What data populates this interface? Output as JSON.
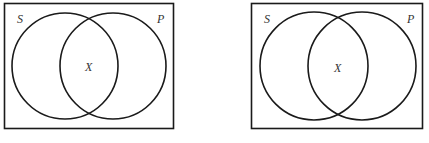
{
  "diagrams": [
    {
      "name": "venn-left",
      "labels": {
        "subject": "S",
        "predicate": "P",
        "middle": "X"
      }
    },
    {
      "name": "venn-right",
      "labels": {
        "subject": "S",
        "predicate": "P",
        "middle": "X"
      }
    }
  ],
  "colors": {
    "stroke": "#1a1a1a",
    "text": "#333333",
    "background": "#ffffff"
  }
}
